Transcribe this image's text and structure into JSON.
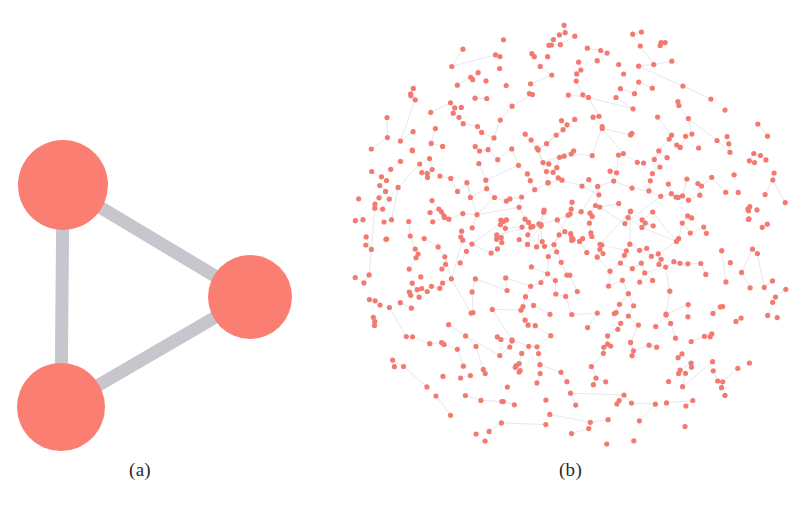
{
  "figure": {
    "background_color": "#ffffff",
    "width": 811,
    "height": 511,
    "panels": [
      {
        "id": "a",
        "caption": "(a)"
      },
      {
        "id": "b",
        "caption": "(b)"
      }
    ]
  },
  "colors": {
    "node_fill": "#fa7e72",
    "node_fill_small": "#f4796f",
    "edge_gray": "#c6c6cc",
    "edge_thin": "#b9bfd0",
    "caption_text": "#2b2b2b"
  },
  "chart_data": [
    {
      "type": "graph",
      "id": "a",
      "title": "(a)",
      "description": "Triangle graph with three large nodes and three thick edges",
      "node_count": 3,
      "edge_count": 3,
      "node_radius_px": [
        45,
        44,
        42
      ],
      "node_color": "#fa7e72",
      "edge_color": "#c6c6cc",
      "edge_width_px": 13,
      "nodes": [
        {
          "id": "n1",
          "x": 63,
          "y": 185,
          "r": 45
        },
        {
          "id": "n2",
          "x": 61,
          "y": 407,
          "r": 44
        },
        {
          "id": "n3",
          "x": 250,
          "y": 297,
          "r": 42
        }
      ],
      "edges": [
        {
          "source": "n1",
          "target": "n2"
        },
        {
          "source": "n1",
          "target": "n3"
        },
        {
          "source": "n2",
          "target": "n3"
        }
      ]
    },
    {
      "type": "graph",
      "id": "b",
      "title": "(b)",
      "description": "Large sparse force-directed network with several hundred small nodes and thin light edges, radially dense toward center",
      "node_count": 560,
      "node_color": "#f4796f",
      "node_radius_px": 2.6,
      "edge_color": "#b9bfd0",
      "edge_width_px": 0.5,
      "layout": "force-directed radial",
      "center": {
        "x": 240,
        "y": 237
      },
      "extent_px": {
        "x_min": 12,
        "x_max": 470,
        "y_min": 10,
        "y_max": 460
      }
    }
  ]
}
